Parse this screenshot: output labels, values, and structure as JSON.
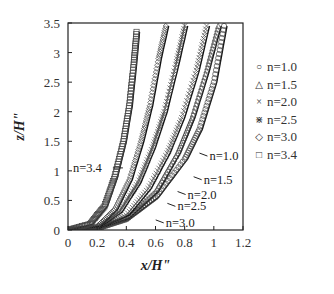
{
  "chart_data": {
    "type": "line",
    "title": "",
    "xlabel": "x/H\"",
    "ylabel": "z/H\"",
    "xlim": [
      0,
      1.2
    ],
    "ylim": [
      0,
      3.5
    ],
    "xticks": [
      "0",
      "0.2",
      "0.4",
      "0.6",
      "0.8",
      "1",
      "1.2"
    ],
    "yticks": [
      "0",
      "0.5",
      "1",
      "1.5",
      "2",
      "2.5",
      "3",
      "3.5"
    ],
    "grid": false,
    "legend_position": "right-outside",
    "legend": [
      {
        "marker": "circle",
        "symbol": "○",
        "label": "n=1.0"
      },
      {
        "marker": "triangle",
        "symbol": "△",
        "label": "n=1.5"
      },
      {
        "marker": "x",
        "symbol": "×",
        "label": "n=2.0"
      },
      {
        "marker": "asterisk",
        "symbol": "⋇",
        "label": "n=2.5"
      },
      {
        "marker": "diamond",
        "symbol": "◇",
        "label": "n=3.0"
      },
      {
        "marker": "square",
        "symbol": "□",
        "label": "n=3.4"
      }
    ],
    "series": [
      {
        "name": "n=1.0",
        "marker": "circle",
        "x": [
          0,
          0.2,
          0.4,
          0.6,
          0.8,
          0.9,
          1.0,
          1.07
        ],
        "y": [
          0,
          0.03,
          0.18,
          0.55,
          1.2,
          1.7,
          2.5,
          3.45
        ]
      },
      {
        "name": "n=1.5",
        "marker": "triangle",
        "x": [
          0,
          0.2,
          0.4,
          0.6,
          0.75,
          0.85,
          0.95,
          1.03
        ],
        "y": [
          0,
          0.03,
          0.2,
          0.65,
          1.3,
          1.9,
          2.7,
          3.45
        ]
      },
      {
        "name": "n=2.0",
        "marker": "x",
        "x": [
          0,
          0.2,
          0.4,
          0.55,
          0.68,
          0.78,
          0.88,
          0.95
        ],
        "y": [
          0,
          0.04,
          0.25,
          0.7,
          1.3,
          1.9,
          2.7,
          3.45
        ]
      },
      {
        "name": "n=2.5",
        "marker": "asterisk",
        "x": [
          0,
          0.2,
          0.35,
          0.48,
          0.58,
          0.66,
          0.74,
          0.8
        ],
        "y": [
          0,
          0.05,
          0.3,
          0.8,
          1.4,
          2.0,
          2.8,
          3.45
        ]
      },
      {
        "name": "n=3.0",
        "marker": "diamond",
        "x": [
          0,
          0.2,
          0.32,
          0.42,
          0.5,
          0.56,
          0.62,
          0.67
        ],
        "y": [
          0,
          0.06,
          0.35,
          0.85,
          1.5,
          2.1,
          2.9,
          3.45
        ]
      },
      {
        "name": "n=3.4",
        "marker": "square",
        "x": [
          0,
          0.15,
          0.25,
          0.32,
          0.38,
          0.42,
          0.45,
          0.47
        ],
        "y": [
          0,
          0.1,
          0.4,
          0.9,
          1.5,
          2.1,
          2.8,
          3.35
        ]
      },
      {
        "name": "pred-n=3.4",
        "marker": "none",
        "x": [
          0.18,
          0.4,
          0.6
        ],
        "y": [
          0.35,
          1.0,
          3.5
        ]
      },
      {
        "name": "pred-n=2.5",
        "marker": "none",
        "x": [
          0.72
        ],
        "y": [
          3.5
        ]
      }
    ],
    "annotations": [
      {
        "text": "n=1.0",
        "x": 0.97,
        "y": 1.25
      },
      {
        "text": "n=1.5",
        "x": 0.93,
        "y": 0.85
      },
      {
        "text": "n=2.0",
        "x": 0.82,
        "y": 0.6
      },
      {
        "text": "n=2.5",
        "x": 0.75,
        "y": 0.4
      },
      {
        "text": "n=3.0",
        "x": 0.67,
        "y": 0.12
      },
      {
        "text": "n=3.4",
        "x": 0.02,
        "y": 1.05
      }
    ]
  }
}
